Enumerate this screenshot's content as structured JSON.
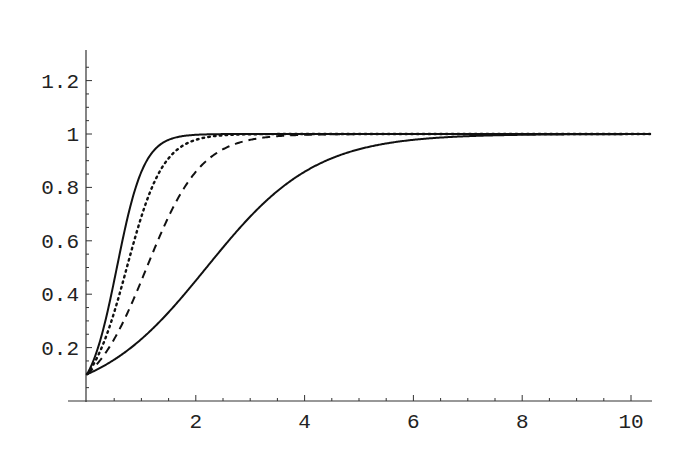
{
  "chart_data": {
    "type": "line",
    "title": "",
    "xlabel": "",
    "ylabel": "",
    "xlim": [
      0,
      10.35
    ],
    "ylim": [
      0,
      1.31
    ],
    "grid": false,
    "legend": null,
    "x_ticks": [
      2,
      4,
      6,
      8,
      10
    ],
    "x_tick_labels": [
      "2",
      "4",
      "6",
      "8",
      "10"
    ],
    "y_ticks": [
      0.2,
      0.4,
      0.6,
      0.8,
      1.0,
      1.2
    ],
    "y_tick_labels": [
      "0.2",
      "0.4",
      "0.6",
      "0.8",
      "1",
      "1.2"
    ],
    "series": [
      {
        "name": "curve-1",
        "style": "solid",
        "formula": "1/(1+9*exp(-4x))",
        "k": 4,
        "x": [
          0,
          0.25,
          0.5,
          0.75,
          1,
          1.25,
          1.5,
          2,
          3,
          10.35
        ],
        "values": [
          0.1,
          0.23,
          0.45,
          0.69,
          0.86,
          0.94,
          0.98,
          1.0,
          1.0,
          1.0
        ]
      },
      {
        "name": "curve-2",
        "style": "dotted",
        "formula": "1/(1+9*exp(-3x))",
        "k": 3,
        "x": [
          0,
          0.25,
          0.5,
          0.75,
          1,
          1.5,
          2,
          2.5,
          3,
          10.35
        ],
        "values": [
          0.1,
          0.19,
          0.33,
          0.51,
          0.69,
          0.91,
          0.98,
          0.99,
          1.0,
          1.0
        ]
      },
      {
        "name": "curve-3",
        "style": "dashed",
        "formula": "1/(1+9*exp(-2x))",
        "k": 2,
        "x": [
          0,
          0.5,
          1,
          1.5,
          2,
          2.5,
          3,
          4,
          10.35
        ],
        "values": [
          0.1,
          0.23,
          0.45,
          0.69,
          0.86,
          0.94,
          0.98,
          1.0,
          1.0
        ]
      },
      {
        "name": "curve-4",
        "style": "solid",
        "formula": "1/(1+9*exp(-x))",
        "k": 1,
        "x": [
          0,
          1,
          2,
          3,
          4,
          5,
          6,
          7,
          8,
          10.35
        ],
        "values": [
          0.1,
          0.23,
          0.45,
          0.69,
          0.86,
          0.94,
          0.98,
          0.99,
          1.0,
          1.0
        ]
      }
    ]
  },
  "plot": {
    "origin_px": [
      87,
      401
    ],
    "x_scale_px": 54.4,
    "y_scale_px": 267,
    "x_axis_end_px": 652,
    "y_axis_top_px": 50,
    "minor_ticks_x": 0.5,
    "minor_ticks_y": 0.05,
    "curve_color": "#111111",
    "axis_color": "#333333"
  }
}
